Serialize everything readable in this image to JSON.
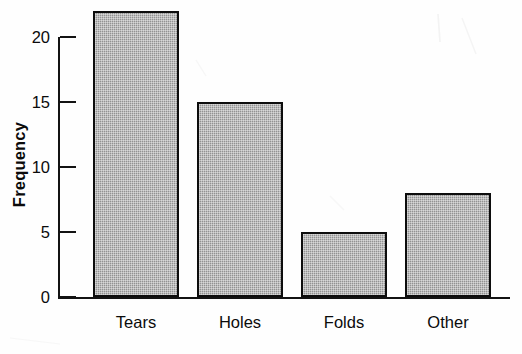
{
  "chart_data": {
    "type": "bar",
    "title": "",
    "subtitle": "",
    "xlabel": "",
    "ylabel": "Frequency",
    "categories": [
      "Tears",
      "Holes",
      "Folds",
      "Other"
    ],
    "values": [
      22,
      15,
      5,
      8
    ],
    "ylim": [
      0,
      22
    ],
    "y_ticks": [
      0,
      5,
      10,
      15,
      20
    ],
    "y_tick_labels": [
      "0",
      "5",
      "10",
      "15",
      "20"
    ],
    "grid": false,
    "legend": null,
    "annotations": [],
    "bar_fill_color": "#9e9e9e",
    "bar_edge_color": "#0d0d0d",
    "background_color": "#ffffff",
    "axis_color": "#131313"
  }
}
